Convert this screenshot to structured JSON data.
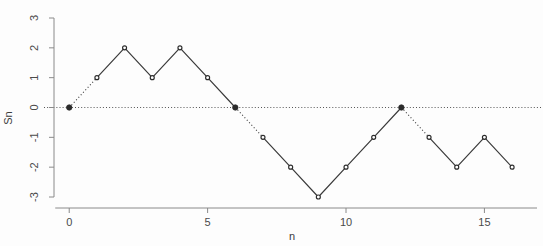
{
  "chart_data": {
    "type": "line",
    "title": "",
    "subtitle": "",
    "xlabel": "n",
    "ylabel": "Sn",
    "x": [
      0,
      1,
      2,
      3,
      4,
      5,
      6,
      7,
      8,
      9,
      10,
      11,
      12,
      13,
      14,
      15,
      16
    ],
    "values": [
      0,
      1,
      2,
      1,
      2,
      1,
      0,
      -1,
      -2,
      -3,
      -2,
      -1,
      0,
      -1,
      -2,
      -1,
      -2
    ],
    "series": [
      {
        "name": "Sn",
        "values": [
          0,
          1,
          2,
          1,
          2,
          1,
          0,
          -1,
          -2,
          -3,
          -2,
          -1,
          0,
          -1,
          -2,
          -1,
          -2
        ]
      }
    ],
    "xlim": [
      -0.55,
      16.9
    ],
    "ylim": [
      -3.0,
      3.0
    ],
    "xticks": [
      0,
      5,
      10,
      15
    ],
    "xtick_labels": [
      "0",
      "5",
      "10",
      "15"
    ],
    "yticks": [
      3,
      2,
      1,
      0,
      -1,
      -2,
      -3
    ],
    "ytick_labels": [
      "3",
      "2",
      "1",
      "0",
      "-1",
      "-2",
      "-3"
    ],
    "grid": false,
    "legend": "none",
    "zero_reference_line": {
      "value": 0,
      "style": "dotted",
      "color": "#555555"
    },
    "dotted_segments": [
      {
        "from_index": 0,
        "to_index": 1
      },
      {
        "from_index": 6,
        "to_index": 7
      },
      {
        "from_index": 12,
        "to_index": 13
      }
    ],
    "zero_crossing_indices": [
      0,
      6,
      12
    ],
    "line_color": "#3a3a3a",
    "marker_color": "#2b2b2b",
    "axis_color": "#8a8a8a",
    "background_color": "#fdfdfd"
  },
  "axes": {
    "y_label": "Sn",
    "x_label": "n"
  }
}
